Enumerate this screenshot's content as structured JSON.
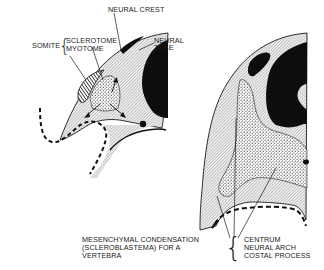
{
  "figure": {
    "type": "embryology-diagram",
    "panels": [
      {
        "id": "early",
        "description": "Somite stage cross-section"
      },
      {
        "id": "later",
        "description": "Sclerotome migration cross-section"
      }
    ]
  },
  "labels": {
    "somite": "SOMITE",
    "sclerotome": "SCLEROTOME",
    "myotome": "MYOTOME",
    "neural_crest": "NEURAL CREST",
    "neural_tube_line1": "NEURAL",
    "neural_tube_line2": "TUBE",
    "mesenchymal_line1": "MESENCHYMAL CONDENSATION",
    "mesenchymal_line2": "(SCLEROBLASTEMA) FOR A",
    "mesenchymal_line3": "VERTEBRA",
    "centrum": "CENTRUM",
    "neural_arch": "NEURAL ARCH",
    "costal_process": "COSTAL PROCESS"
  },
  "colors": {
    "ink": "#1a1a1a",
    "hatch_bg": "#e4e4e4",
    "background": "#ffffff"
  }
}
